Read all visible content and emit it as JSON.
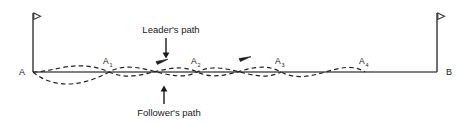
{
  "diagram": {
    "colors": {
      "stroke": "#333333",
      "baseline": "#555555",
      "dashed": "#222222",
      "text": "#1a1a1a",
      "background": "#ffffff"
    },
    "endpoints": [
      {
        "id": "A",
        "label": "A",
        "x": 33,
        "y": 72
      },
      {
        "id": "B",
        "label": "B",
        "x": 437,
        "y": 72
      }
    ],
    "nodes": [
      {
        "id": "A1",
        "base": "A",
        "sub": "1",
        "x": 109,
        "y": 72
      },
      {
        "id": "A2",
        "base": "A",
        "sub": "2",
        "x": 197,
        "y": 72
      },
      {
        "id": "A3",
        "base": "A",
        "sub": "3",
        "x": 281,
        "y": 72
      },
      {
        "id": "A4",
        "base": "A",
        "sub": "4",
        "x": 365,
        "y": 72
      }
    ],
    "annotations": [
      {
        "id": "leader",
        "label": "Leader's path",
        "text_x": 171,
        "text_y": 33,
        "arrow_from_y": 38,
        "arrow_to_y": 57,
        "arrow_x": 166,
        "direction": "down"
      },
      {
        "id": "follower",
        "label": "Follower's path",
        "text_x": 169,
        "text_y": 113,
        "arrow_from_y": 105,
        "arrow_to_y": 86,
        "arrow_x": 164,
        "direction": "up"
      }
    ],
    "flagpoles": [
      {
        "id": "flagpole-left",
        "x": 33,
        "top_y": 13,
        "bottom_y": 72,
        "flag_dir": "right"
      },
      {
        "id": "flagpole-right",
        "x": 437,
        "top_y": 13,
        "bottom_y": 72,
        "flag_dir": "right"
      }
    ],
    "baseline": {
      "x1": 33,
      "x2": 437,
      "y": 72
    },
    "path_arrows": [
      {
        "id": "leader-arrow-1",
        "x": 163,
        "y": 60
      },
      {
        "id": "leader-arrow-2",
        "x": 246,
        "y": 57
      }
    ],
    "leader_path": "M 33 72 C 55 72, 78 58, 109 72 C 140 86, 168 58, 197 72 C 228 86, 252 56, 281 72 C 312 88, 340 56, 365 72 L 437 72",
    "follower_path": "M 33 72 C 52 88, 80 88, 109 72 C 138 56, 170 86, 197 72 C 226 58, 254 86, 281 72"
  }
}
